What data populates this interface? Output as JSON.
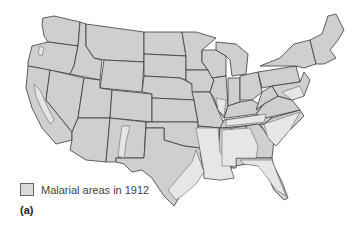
{
  "map": {
    "subject": "United States",
    "colors": {
      "state_fill": "#cfcfcf",
      "malarial_fill": "#e6e6e6",
      "border": "#3a3a3a"
    }
  },
  "legend": {
    "label": "Malarial areas in 1912",
    "swatch_color": "#d9d9d9"
  },
  "caption": "(a)"
}
